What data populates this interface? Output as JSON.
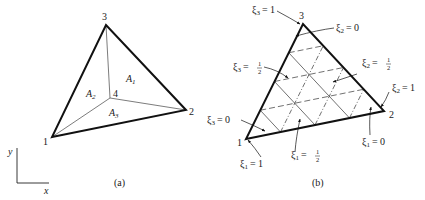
{
  "figure_a": {
    "caption": "(a)",
    "vertices": [
      {
        "id": "1",
        "label": "1",
        "x": 52,
        "y": 137
      },
      {
        "id": "2",
        "label": "2",
        "x": 186,
        "y": 110
      },
      {
        "id": "3",
        "label": "3",
        "x": 106,
        "y": 25
      },
      {
        "id": "4",
        "label": "4",
        "x": 110,
        "y": 98
      }
    ],
    "areas": [
      {
        "id": "A1",
        "label": "A",
        "sub": "1"
      },
      {
        "id": "A2",
        "label": "A",
        "sub": "2"
      },
      {
        "id": "A3",
        "label": "A",
        "sub": "3"
      }
    ],
    "axes": {
      "x_label": "x",
      "y_label": "y"
    }
  },
  "figure_b": {
    "caption": "(b)",
    "vertices": [
      {
        "id": "1",
        "label": "1",
        "x": 246,
        "y": 139
      },
      {
        "id": "2",
        "label": "2",
        "x": 384,
        "y": 111
      },
      {
        "id": "3",
        "label": "3",
        "x": 303,
        "y": 24
      }
    ],
    "annotations": [
      {
        "id": "xi3_1",
        "symbol": "ξ",
        "sub": "3",
        "eq": "= 1"
      },
      {
        "id": "xi2_0",
        "symbol": "ξ",
        "sub": "2",
        "eq": "= 0"
      },
      {
        "id": "xi3_half",
        "symbol": "ξ",
        "sub": "3",
        "eq": "=",
        "frac_num": "1",
        "frac_den": "2"
      },
      {
        "id": "xi2_half",
        "symbol": "ξ",
        "sub": "2",
        "eq": "=",
        "frac_num": "1",
        "frac_den": "2"
      },
      {
        "id": "xi2_1",
        "symbol": "ξ",
        "sub": "2",
        "eq": "= 1"
      },
      {
        "id": "xi3_0",
        "symbol": "ξ",
        "sub": "3",
        "eq": "= 0"
      },
      {
        "id": "xi1_1",
        "symbol": "ξ",
        "sub": "1",
        "eq": "= 1"
      },
      {
        "id": "xi1_half",
        "symbol": "ξ",
        "sub": "1",
        "eq": "=",
        "frac_num": "1",
        "frac_den": "2"
      },
      {
        "id": "xi1_0",
        "symbol": "ξ",
        "sub": "1",
        "eq": "= 0"
      }
    ],
    "grid_divisions": 4
  },
  "colors": {
    "line": "#111111",
    "thin": "#333333",
    "background": "#ffffff"
  }
}
